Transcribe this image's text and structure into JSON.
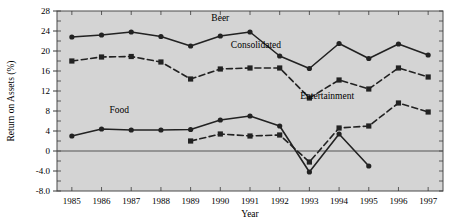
{
  "chart_data": {
    "type": "line",
    "title": "",
    "xlabel": "Year",
    "ylabel": "Return on Assets (%)",
    "x": [
      1985,
      1986,
      1987,
      1988,
      1989,
      1990,
      1991,
      1992,
      1993,
      1994,
      1995,
      1996,
      1997
    ],
    "categories": [
      "1985",
      "1986",
      "1987",
      "1988",
      "1989",
      "1990",
      "1991",
      "1992",
      "1993",
      "1994",
      "1995",
      "1996",
      "1997"
    ],
    "xlim": [
      1984.5,
      1997.5
    ],
    "ylim": [
      -8.0,
      28.0
    ],
    "yticks": [
      "28",
      "24",
      "20",
      "16",
      "12",
      "8",
      "4",
      "0",
      "-4.0",
      "-8.0"
    ],
    "ytick_values": [
      28,
      24,
      20,
      16,
      12,
      8,
      4,
      0,
      -4.0,
      -8.0
    ],
    "grid": false,
    "legend": "inline-labels",
    "plot_background": "#d4d4d4",
    "series": [
      {
        "name": "Beer",
        "line": "solid",
        "marker": "circle",
        "color": "#222222",
        "label_x": 1990.0,
        "label_y": 26.0,
        "values": [
          22.8,
          23.2,
          23.8,
          22.9,
          21.0,
          23.0,
          23.8,
          19.0,
          16.5,
          21.5,
          18.5,
          21.4,
          19.2
        ]
      },
      {
        "name": "Consolidated",
        "line": "dashed",
        "marker": "square",
        "color": "#222222",
        "label_x": 1991.2,
        "label_y": 20.6,
        "values": [
          18.0,
          18.8,
          18.9,
          17.8,
          14.4,
          16.4,
          16.6,
          16.6,
          10.6,
          14.2,
          12.4,
          16.6,
          14.8
        ]
      },
      {
        "name": "Food",
        "line": "solid",
        "marker": "circle",
        "color": "#222222",
        "label_x": 1986.6,
        "label_y": 7.6,
        "values": [
          3.0,
          4.4,
          4.2,
          4.2,
          4.3,
          6.2,
          7.0,
          5.0,
          -4.2,
          3.4,
          -3.0,
          null,
          null
        ]
      },
      {
        "name": "Entertainment",
        "line": "dashed",
        "marker": "square",
        "color": "#222222",
        "label_x": 1993.6,
        "label_y": 10.4,
        "values": [
          null,
          null,
          null,
          null,
          2.0,
          3.4,
          3.0,
          3.2,
          -2.2,
          4.6,
          5.0,
          9.6,
          7.8
        ]
      }
    ]
  }
}
